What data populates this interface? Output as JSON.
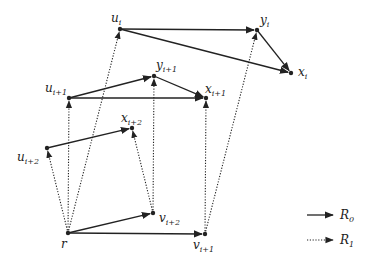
{
  "diagram": {
    "nodes": [
      {
        "id": "u_i",
        "base": "u",
        "sub": "i",
        "x": 120,
        "y": 29,
        "lx": 111,
        "ly": 22
      },
      {
        "id": "y_i",
        "base": "y",
        "sub": "i",
        "x": 257,
        "y": 30,
        "lx": 260,
        "ly": 24
      },
      {
        "id": "x_i",
        "base": "x",
        "sub": "i",
        "x": 291,
        "y": 73,
        "lx": 298,
        "ly": 76
      },
      {
        "id": "u_i+1",
        "base": "u",
        "sub": "i+1",
        "x": 69,
        "y": 98,
        "lx": 45,
        "ly": 92
      },
      {
        "id": "y_i+1",
        "base": "y",
        "sub": "i+1",
        "x": 154,
        "y": 76,
        "lx": 156,
        "ly": 69
      },
      {
        "id": "x_i+1",
        "base": "x",
        "sub": "i+1",
        "x": 206,
        "y": 98,
        "lx": 205,
        "ly": 93
      },
      {
        "id": "x_i+2",
        "base": "x",
        "sub": "i+2",
        "x": 132,
        "y": 128,
        "lx": 121,
        "ly": 122
      },
      {
        "id": "u_i+2",
        "base": "u",
        "sub": "i+2",
        "x": 47,
        "y": 148,
        "lx": 17,
        "ly": 161
      },
      {
        "id": "v_i+2",
        "base": "v",
        "sub": "i+2",
        "x": 153,
        "y": 213,
        "lx": 159,
        "ly": 222
      },
      {
        "id": "r",
        "base": "r",
        "sub": "",
        "x": 68,
        "y": 233,
        "lx": 61,
        "ly": 248
      },
      {
        "id": "v_i+1",
        "base": "v",
        "sub": "i+1",
        "x": 205,
        "y": 234,
        "lx": 193,
        "ly": 249
      }
    ],
    "edges_R0": [
      [
        "u_i",
        "y_i"
      ],
      [
        "u_i",
        "x_i"
      ],
      [
        "y_i",
        "x_i"
      ],
      [
        "u_i+1",
        "y_i+1"
      ],
      [
        "u_i+1",
        "x_i+1"
      ],
      [
        "y_i+1",
        "x_i+1"
      ],
      [
        "u_i+2",
        "x_i+2"
      ],
      [
        "r",
        "v_i+2"
      ],
      [
        "r",
        "v_i+1"
      ]
    ],
    "edges_R1": [
      [
        "r",
        "u_i"
      ],
      [
        "r",
        "u_i+1"
      ],
      [
        "r",
        "u_i+2"
      ],
      [
        "v_i+2",
        "y_i+1"
      ],
      [
        "v_i+2",
        "x_i+2"
      ],
      [
        "v_i+1",
        "x_i+1"
      ],
      [
        "v_i+1",
        "y_i"
      ]
    ]
  },
  "legend": {
    "r0": {
      "base": "R",
      "sub": "0",
      "style": "solid"
    },
    "r1": {
      "base": "R",
      "sub": "1",
      "style": "dotted"
    }
  },
  "colors": {
    "stroke": "#222222",
    "background": "#ffffff"
  }
}
